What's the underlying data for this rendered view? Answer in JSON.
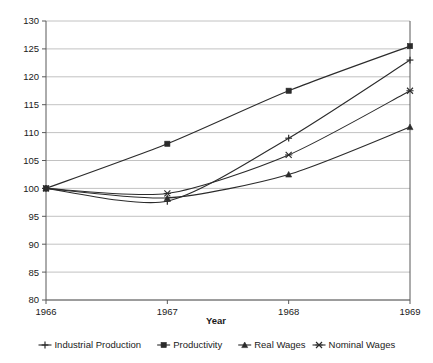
{
  "chart_data": {
    "type": "line",
    "title": "",
    "xlabel": "Year",
    "ylabel": "",
    "x": [
      1966,
      1967,
      1968,
      1969
    ],
    "categories": [
      "1966",
      "1967",
      "1968",
      "1969"
    ],
    "xtick_labels": [
      "1966",
      "1967",
      "1968",
      "1969"
    ],
    "ytick_labels": [
      "80",
      "85",
      "90",
      "95",
      "100",
      "105",
      "110",
      "115",
      "120",
      "125",
      "130"
    ],
    "yticks": [
      80,
      85,
      90,
      95,
      100,
      105,
      110,
      115,
      120,
      125,
      130
    ],
    "ylim": [
      80,
      130
    ],
    "xlim": [
      1966,
      1969
    ],
    "grid": true,
    "legend_position": "bottom",
    "series": [
      {
        "name": "Industrial Production",
        "marker": "plus",
        "color": "#2b2b2b",
        "values": [
          100,
          97.7,
          109,
          123
        ]
      },
      {
        "name": "Productivity",
        "marker": "square",
        "color": "#2b2b2b",
        "values": [
          100,
          108,
          117.5,
          125.5
        ]
      },
      {
        "name": "Real Wages",
        "marker": "triangle",
        "color": "#2b2b2b",
        "values": [
          100,
          98.3,
          102.5,
          111
        ]
      },
      {
        "name": "Nominal Wages",
        "marker": "cross",
        "color": "#2b2b2b",
        "values": [
          100,
          99.1,
          106,
          117.5
        ]
      }
    ]
  },
  "axis": {
    "x_title": "Year"
  },
  "legend": {
    "entries": [
      {
        "label": "Industrial Production"
      },
      {
        "label": "Productivity"
      },
      {
        "label": "Real Wages"
      },
      {
        "label": "Nominal Wages"
      }
    ]
  },
  "colors": {
    "line": "#2b2b2b",
    "grid": "#b3b3b3",
    "axis": "#595959",
    "text": "#1a1a1a",
    "background": "#ffffff"
  }
}
